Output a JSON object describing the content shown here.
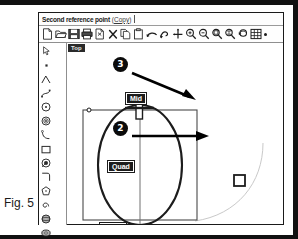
{
  "figure": {
    "caption": "Fig. 5"
  },
  "app": {
    "titlebar": {
      "prompt": "Second reference point",
      "hint_open": "(",
      "hint_word": "Copy",
      "hint_close": ")"
    },
    "toolbar": {
      "buttons": [
        {
          "name": "new-file-icon",
          "label": "New"
        },
        {
          "name": "open-folder-icon",
          "label": "Open"
        },
        {
          "name": "save-disk-icon",
          "label": "Save"
        },
        {
          "name": "print-icon",
          "label": "Print"
        },
        {
          "name": "cut-icon",
          "label": "Cut"
        },
        {
          "name": "delete-x-icon",
          "label": "Delete"
        },
        {
          "name": "copy-icon",
          "label": "Copy"
        },
        {
          "name": "paste-icon",
          "label": "Paste"
        },
        {
          "name": "undo-arrow-icon",
          "label": "Undo"
        },
        {
          "name": "redo-arrow-icon",
          "label": "Redo"
        },
        {
          "name": "pan-move-icon",
          "label": "Pan"
        },
        {
          "name": "zoom-in-icon",
          "label": "Zoom In"
        },
        {
          "name": "zoom-out-icon",
          "label": "Zoom Out"
        },
        {
          "name": "zoom-window-icon",
          "label": "Zoom Window"
        },
        {
          "name": "zoom-extents-icon",
          "label": "Zoom Extents"
        },
        {
          "name": "zoom-previous-icon",
          "label": "Zoom Previous"
        },
        {
          "name": "grid-snap-icon",
          "label": "Grid"
        },
        {
          "name": "more-options-icon",
          "label": "More"
        }
      ]
    },
    "palette": {
      "buttons": [
        {
          "name": "select-arrow-icon",
          "label": "Select"
        },
        {
          "name": "point-icon",
          "label": "Point"
        },
        {
          "name": "polyline-icon",
          "label": "Polyline"
        },
        {
          "name": "curve-icon",
          "label": "Curve"
        },
        {
          "name": "circle-center-icon",
          "label": "Circle"
        },
        {
          "name": "ellipse-icon",
          "label": "Ellipse"
        },
        {
          "name": "arc-icon",
          "label": "Arc"
        },
        {
          "name": "rectangle-icon",
          "label": "Rectangle"
        },
        {
          "name": "circle-diameter-icon",
          "label": "Circle Diameter"
        },
        {
          "name": "fillet-corner-icon",
          "label": "Fillet"
        },
        {
          "name": "polygon-icon",
          "label": "Polygon"
        },
        {
          "name": "spiral-icon",
          "label": "Spiral"
        },
        {
          "name": "sphere-icon",
          "label": "Sphere"
        },
        {
          "name": "torus-icon",
          "label": "Torus"
        },
        {
          "name": "cylinder-icon",
          "label": "Cylinder"
        },
        {
          "name": "box-solid-icon",
          "label": "Box"
        },
        {
          "name": "surface-loft-icon",
          "label": "Loft"
        },
        {
          "name": "surface-sweep-icon",
          "label": "Sweep"
        },
        {
          "name": "boolean-union-icon",
          "label": "Union"
        },
        {
          "name": "boolean-difference-icon",
          "label": "Difference"
        },
        {
          "name": "extrude-icon",
          "label": "Extrude"
        },
        {
          "name": "revolve-icon",
          "label": "Revolve"
        },
        {
          "name": "trim-icon",
          "label": "Trim"
        },
        {
          "name": "offset-icon",
          "label": "Offset"
        }
      ]
    },
    "viewport": {
      "label": "Top",
      "snaps": [
        {
          "name": "snap-mid",
          "label": "Mid"
        },
        {
          "name": "snap-quad-center",
          "label": "Quad"
        },
        {
          "name": "snap-quad-bottom",
          "label": "Quad"
        }
      ],
      "callouts": [
        {
          "name": "callout-3",
          "label": "3"
        },
        {
          "name": "callout-2",
          "label": "2"
        }
      ]
    }
  }
}
